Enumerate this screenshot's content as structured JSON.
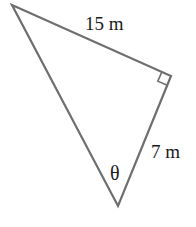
{
  "diagram": {
    "type": "right-triangle",
    "vertices": {
      "top_left": {
        "x": 12,
        "y": 5
      },
      "right_angle": {
        "x": 171,
        "y": 76
      },
      "bottom": {
        "x": 118,
        "y": 206
      }
    },
    "labels": {
      "hypotenuse_side": "15 m",
      "leg_side": "7 m",
      "angle": "θ"
    },
    "right_angle_marker": true,
    "stroke_color": "#6e6e6e",
    "text_color": "#1a1a1a"
  }
}
